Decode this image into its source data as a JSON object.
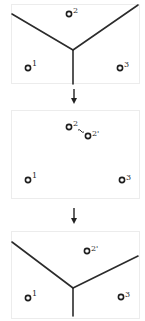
{
  "figure": {
    "colors": {
      "edge": "#2b2b2b",
      "site": "#1e1e1e",
      "frame": "#ececec",
      "background": "#ffffff"
    },
    "panels": [
      {
        "id": "panel-initial",
        "frame": {
          "x": 11,
          "y": 4,
          "w": 128,
          "h": 79
        },
        "sites": [
          {
            "id": "2",
            "label": "2",
            "x": 69,
            "y": 14
          },
          {
            "id": "1",
            "label": "1",
            "x": 28,
            "y": 68
          },
          {
            "id": "3",
            "label": "3",
            "x": 120,
            "y": 68
          }
        ],
        "edges": [
          {
            "x1": 12,
            "y1": 14,
            "x2": 73,
            "y2": 50
          },
          {
            "x1": 138,
            "y1": 5,
            "x2": 73,
            "y2": 50
          },
          {
            "x1": 73,
            "y1": 50,
            "x2": 73,
            "y2": 84
          }
        ]
      },
      {
        "id": "panel-move",
        "frame": {
          "x": 11,
          "y": 110,
          "w": 128,
          "h": 88
        },
        "sites": [
          {
            "id": "2",
            "label": "2",
            "x": 69,
            "y": 127
          },
          {
            "id": "2p",
            "label": "2'",
            "x": 88,
            "y": 136
          },
          {
            "id": "1",
            "label": "1",
            "x": 28,
            "y": 180
          },
          {
            "id": "3",
            "label": "3",
            "x": 122,
            "y": 180
          }
        ],
        "move_link": {
          "from": "2",
          "to": "2p"
        },
        "edges": []
      },
      {
        "id": "panel-updated",
        "frame": {
          "x": 11,
          "y": 231,
          "w": 128,
          "h": 87
        },
        "sites": [
          {
            "id": "2p",
            "label": "2'",
            "x": 87,
            "y": 251
          },
          {
            "id": "1",
            "label": "1",
            "x": 28,
            "y": 298
          },
          {
            "id": "3",
            "label": "3",
            "x": 121,
            "y": 297
          }
        ],
        "edges": [
          {
            "x1": 12,
            "y1": 242,
            "x2": 73,
            "y2": 288
          },
          {
            "x1": 138,
            "y1": 256,
            "x2": 73,
            "y2": 288
          },
          {
            "x1": 73,
            "y1": 288,
            "x2": 73,
            "y2": 316
          }
        ]
      }
    ],
    "arrows": [
      {
        "id": "arrow-1",
        "x": 74,
        "y1": 89,
        "y2": 104
      },
      {
        "id": "arrow-2",
        "x": 74,
        "y1": 208,
        "y2": 224
      }
    ]
  }
}
